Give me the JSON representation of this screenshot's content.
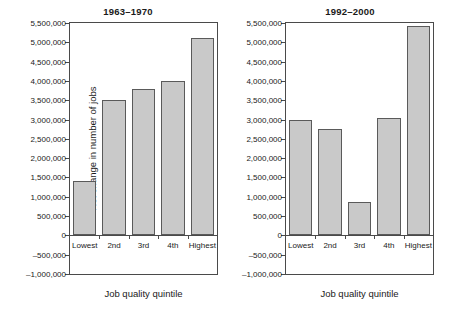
{
  "figure": {
    "width": 456,
    "height": 309,
    "background": "#ffffff",
    "bar_fill": "#c9c9c9",
    "bar_stroke": "#5a5a5a",
    "axis_color": "#4a4a4a"
  },
  "chart_data": [
    {
      "type": "bar",
      "title": "1963–1970",
      "xlabel": "Job quality quintile",
      "ylabel": "Net change in number of jobs",
      "categories": [
        "Lowest",
        "2nd",
        "3rd",
        "4th",
        "Highest"
      ],
      "values": [
        1420000,
        3500000,
        3780000,
        4000000,
        5120000
      ],
      "ylim": [
        -1000000,
        5500000
      ],
      "ytick_values": [
        -1000000,
        -500000,
        0,
        500000,
        1000000,
        1500000,
        2000000,
        2500000,
        3000000,
        3500000,
        4000000,
        4500000,
        5000000,
        5500000
      ],
      "ytick_labels": [
        "–1,000,000",
        "–500,000",
        "0",
        "500,000",
        "1,000,000",
        "1,500,000",
        "2,000,000",
        "2,500,000",
        "3,000,000",
        "3,500,000",
        "4,000,000",
        "4,500,000",
        "5,000,000",
        "5,500,000"
      ],
      "grid": false,
      "legend": null
    },
    {
      "type": "bar",
      "title": "1992–2000",
      "xlabel": "Job quality quintile",
      "ylabel": "",
      "categories": [
        "Lowest",
        "2nd",
        "3rd",
        "4th",
        "Highest"
      ],
      "values": [
        3000000,
        2750000,
        870000,
        3050000,
        5420000
      ],
      "ylim": [
        -1000000,
        5500000
      ],
      "ytick_values": [
        -1000000,
        -500000,
        0,
        500000,
        1000000,
        1500000,
        2000000,
        2500000,
        3000000,
        3500000,
        4000000,
        4500000,
        5000000,
        5500000
      ],
      "ytick_labels": [
        "–1,000,000",
        "–500,000",
        "0",
        "500,000",
        "1,000,000",
        "1,500,000",
        "2,000,000",
        "2,500,000",
        "3,000,000",
        "3,500,000",
        "4,000,000",
        "4,500,000",
        "5,000,000",
        "5,500,000"
      ],
      "grid": false,
      "legend": null
    }
  ]
}
